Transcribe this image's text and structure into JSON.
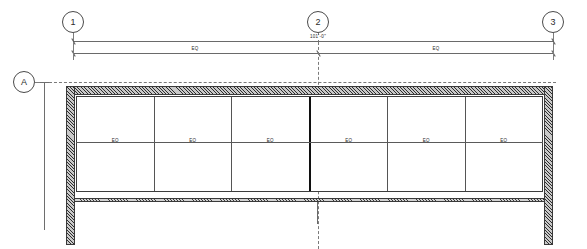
{
  "drawing": {
    "type": "architectural-plan",
    "grid_bubbles": [
      {
        "id": "1",
        "label": "1",
        "axis": "vertical"
      },
      {
        "id": "2",
        "label": "2",
        "axis": "vertical"
      },
      {
        "id": "3",
        "label": "3",
        "axis": "vertical"
      },
      {
        "id": "A",
        "label": "A",
        "axis": "horizontal"
      }
    ],
    "dimensions": {
      "overall": {
        "label": "101'-0\"",
        "from_grid": "1",
        "to_grid": "3"
      },
      "segments": [
        {
          "label": "EQ",
          "from_grid": "1",
          "to_grid": "2"
        },
        {
          "label": "EQ",
          "from_grid": "2",
          "to_grid": "3"
        }
      ]
    },
    "storefront": {
      "panel_label": "EQ",
      "panels": [
        {
          "label": "EQ"
        },
        {
          "label": "EQ"
        },
        {
          "label": "EQ"
        },
        {
          "label": "EQ"
        },
        {
          "label": "EQ"
        },
        {
          "label": "EQ"
        }
      ]
    },
    "colors": {
      "line": "#4d4d4d",
      "wall_hatch": "#2e2e2e",
      "heavy_mullion": "#101010",
      "background": "#ffffff"
    }
  }
}
